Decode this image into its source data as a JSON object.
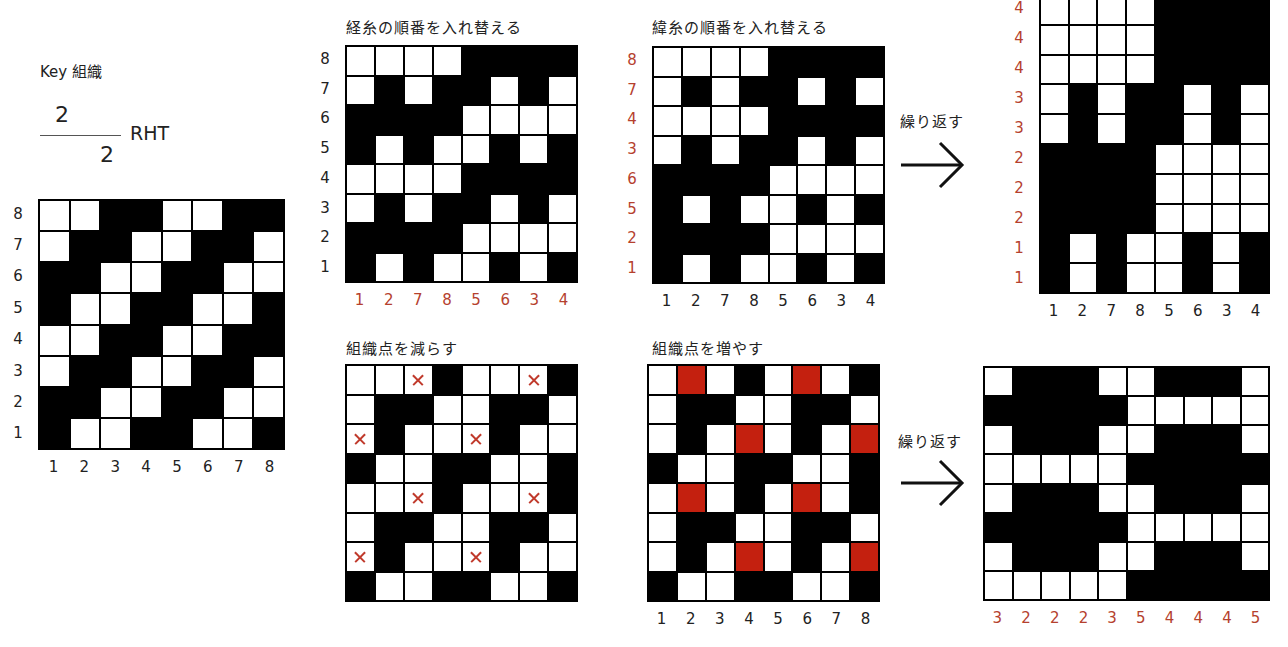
{
  "key": {
    "title": "Key 組織",
    "fraction": {
      "numerator": "2",
      "denominator": "2",
      "direction": "RHT"
    },
    "row_labels": [
      "8",
      "7",
      "6",
      "5",
      "4",
      "3",
      "2",
      "1"
    ],
    "col_labels": [
      "1",
      "2",
      "3",
      "4",
      "5",
      "6",
      "7",
      "8"
    ],
    "rows": [
      "WWBBWWBB",
      "WBBWWBBW",
      "BBWWBBWW",
      "BWWBBWWB",
      "WWBBWWBB",
      "WBBWWBBW",
      "BBWWBBWW",
      "BWWBBWWB"
    ]
  },
  "warp_reorder": {
    "title": "経糸の順番を入れ替える",
    "row_labels": [
      "8",
      "7",
      "6",
      "5",
      "4",
      "3",
      "2",
      "1"
    ],
    "col_labels": [
      "1",
      "2",
      "7",
      "8",
      "5",
      "6",
      "3",
      "4"
    ],
    "rows": [
      "WWWWBBBB",
      "WBWBBWBW",
      "BBBBWWWW",
      "BWBWWBWB",
      "WWWWBBBB",
      "WBWBBWBW",
      "BBBBWWWW",
      "BWBWWBWB"
    ]
  },
  "weft_reorder": {
    "title": "緯糸の順番を入れ替える",
    "row_labels": [
      "8",
      "7",
      "4",
      "3",
      "6",
      "5",
      "2",
      "1"
    ],
    "col_labels": [
      "1",
      "2",
      "7",
      "8",
      "5",
      "6",
      "3",
      "4"
    ],
    "rows": [
      "WWWWBBBB",
      "WBWBBWBW",
      "WWWWBBBB",
      "WBWBBWBW",
      "BBBBWWWW",
      "BWBWWBWB",
      "BBBBWWWW",
      "BWBWWBWB"
    ]
  },
  "repeat_top": {
    "arrow_label": "繰り返す",
    "row_labels": [
      "4",
      "4",
      "4",
      "3",
      "3",
      "2",
      "2",
      "2",
      "1",
      "1"
    ],
    "col_labels": [
      "1",
      "2",
      "7",
      "8",
      "5",
      "6",
      "3",
      "4"
    ],
    "rows": [
      "WWWWBBBB",
      "WWWWBBBB",
      "WWWWBBBB",
      "WBWBBWBW",
      "WBWBBWBW",
      "BBBBWWWW",
      "BBBBWWWW",
      "BBBBWWWW",
      "BWBWWBWB",
      "BWBWWBWB"
    ]
  },
  "reduce_points": {
    "title": "組織点を減らす",
    "rows": [
      "WWXBWWXB",
      "WBBWWBBW",
      "XBWWXBWW",
      "BWWBBWWB",
      "WWXBWWXB",
      "WBBWWBBW",
      "XBWWXBWW",
      "BWWBBWWB"
    ]
  },
  "increase_points": {
    "title": "組織点を増やす",
    "col_labels": [
      "1",
      "2",
      "3",
      "4",
      "5",
      "6",
      "7",
      "8"
    ],
    "rows": [
      "WRWBWRWB",
      "WBBWWBBW",
      "WBWRWBWR",
      "BWWBBWWB",
      "WRWBWRWB",
      "WBBWWBBW",
      "WBWRWBWR",
      "BWWBBWWB"
    ]
  },
  "repeat_bottom": {
    "arrow_label": "繰り返す",
    "col_labels": [
      "3",
      "2",
      "2",
      "2",
      "3",
      "5",
      "4",
      "4",
      "4",
      "5"
    ],
    "rows": [
      "WBBBWWBBBW",
      "BBBBBWWWWW",
      "WBBBWWBBBW",
      "WWWWWBBBBB",
      "WBBBWWBBBW",
      "BBBBBWWWWW",
      "WBBBWWBBBW",
      "WWWWWBBBBB"
    ]
  },
  "colors": {
    "grid_black": "#000000",
    "cell_white": "#ffffff",
    "accent_red_fill": "#c4200f",
    "accent_red_text": "#b5412e"
  }
}
